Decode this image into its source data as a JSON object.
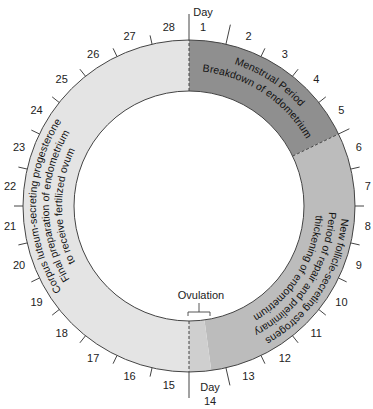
{
  "diagram": {
    "total_days": 28,
    "center": {
      "x": 189,
      "y": 206
    },
    "outer_radius": 166,
    "inner_radius": 115,
    "day_labels": [
      "1",
      "2",
      "3",
      "4",
      "5",
      "6",
      "7",
      "8",
      "9",
      "10",
      "11",
      "12",
      "13",
      "14",
      "15",
      "16",
      "17",
      "18",
      "19",
      "20",
      "21",
      "22",
      "23",
      "24",
      "25",
      "26",
      "27",
      "28"
    ],
    "day_word": "Day",
    "day1_caption": {
      "word": "Day",
      "num": "1"
    },
    "day14_caption": {
      "word": "Day",
      "num": "14"
    },
    "phases": [
      {
        "name": "menstrual",
        "start_day": 1,
        "end_day": 5,
        "color": "#8f8f8f",
        "lines": [
          "Menstrual Period",
          "Breakdown of endometrium"
        ]
      },
      {
        "name": "follicular",
        "start_day": 6,
        "end_day": 14,
        "color": "#bcbcbc",
        "lines": [
          "New follicle-secreting estrogens",
          "Period of repair and preliminary",
          "thickening of endometrium"
        ]
      },
      {
        "name": "luteal",
        "start_day": 15,
        "end_day": 28,
        "color": "#e4e4e4",
        "lines": [
          "Corpus luteum-secreting progesterone",
          "Final preparation of endometrium",
          "to receive fertilized ovum"
        ]
      }
    ],
    "ovulation": {
      "label": "Ovulation",
      "color": "#cfcfcf"
    },
    "colors": {
      "stroke": "#444444",
      "text": "#222222",
      "background": "#ffffff"
    }
  }
}
